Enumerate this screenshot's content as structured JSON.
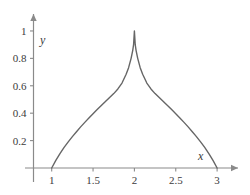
{
  "chart_data": {
    "type": "line",
    "title": "",
    "subtitle": "",
    "xlabel": "x",
    "ylabel": "y",
    "xlim": [
      0.78,
      3.18
    ],
    "ylim": [
      0,
      1.08
    ],
    "xticks": [
      "1",
      "1.5",
      "2",
      "2.5",
      "3"
    ],
    "xtick_values": [
      1,
      1.5,
      2,
      2.5,
      3
    ],
    "yticks": [
      "0.2",
      "0.4",
      "0.6",
      "0.8",
      "1"
    ],
    "ytick_values": [
      0.2,
      0.4,
      0.6,
      0.8,
      1
    ],
    "grid": false,
    "legend": null,
    "legend_position": "none",
    "annotations": [],
    "series": [
      {
        "name": "density",
        "color": "#666666",
        "linewidth": 1.4,
        "x": [
          1.0,
          1.05,
          1.1,
          1.15,
          1.2,
          1.25,
          1.3,
          1.35,
          1.4,
          1.45,
          1.5,
          1.55,
          1.6,
          1.65,
          1.7,
          1.75,
          1.8,
          1.85,
          1.9,
          1.93,
          1.96,
          1.98,
          1.99,
          2.0,
          2.01,
          2.02,
          2.04,
          2.07,
          2.1,
          2.15,
          2.2,
          2.25,
          2.3,
          2.35,
          2.4,
          2.45,
          2.5,
          2.55,
          2.6,
          2.65,
          2.7,
          2.75,
          2.8,
          2.85,
          2.9,
          2.95,
          3.0
        ],
        "y": [
          0.0,
          0.056,
          0.105,
          0.15,
          0.191,
          0.229,
          0.265,
          0.3,
          0.333,
          0.365,
          0.396,
          0.426,
          0.456,
          0.485,
          0.514,
          0.543,
          0.577,
          0.62,
          0.684,
          0.732,
          0.8,
          0.859,
          0.9,
          1.0,
          0.9,
          0.859,
          0.8,
          0.732,
          0.684,
          0.62,
          0.577,
          0.543,
          0.514,
          0.485,
          0.456,
          0.426,
          0.396,
          0.365,
          0.333,
          0.3,
          0.265,
          0.229,
          0.191,
          0.15,
          0.105,
          0.056,
          0.0
        ]
      }
    ]
  },
  "axes": {
    "x_axis_name": "x",
    "y_axis_name": "y",
    "axis_color": "#8a8a8a",
    "text_color": "#3b3b3b"
  }
}
